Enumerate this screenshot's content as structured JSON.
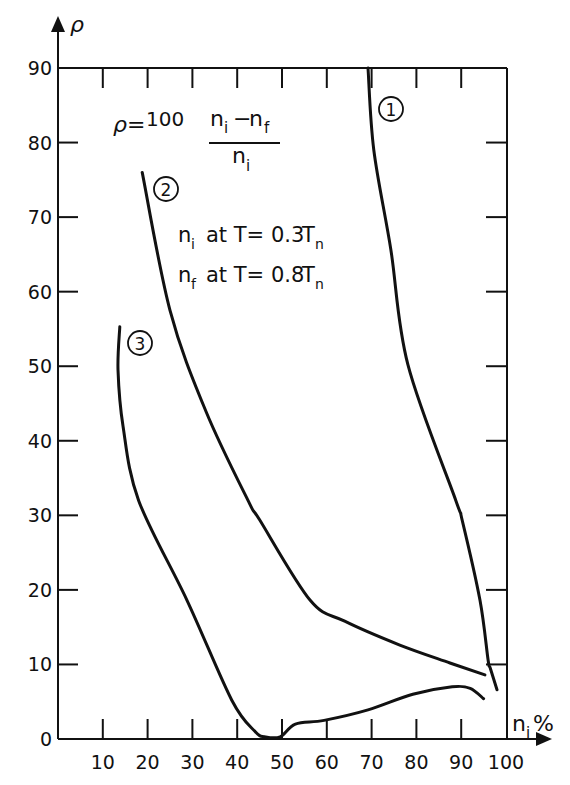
{
  "chart_data": {
    "type": "line",
    "title": "",
    "xlabel": "n_i %",
    "ylabel": "ρ",
    "xlim": [
      0,
      100
    ],
    "ylim": [
      0,
      90
    ],
    "grid": false,
    "x_ticks": [
      10,
      20,
      30,
      40,
      50,
      60,
      70,
      80,
      90,
      100
    ],
    "y_ticks": [
      0,
      10,
      20,
      30,
      40,
      50,
      60,
      70,
      80,
      90
    ],
    "legend": "inline circled numbers next to curves",
    "annotations": {
      "formula_lhs": "ρ =",
      "formula_coef": "100",
      "formula_num": "n_i − n_f",
      "formula_den": "n_i",
      "cond1": "n_i at T= 0.3 T_n",
      "cond2": "n_f at T= 0.8 T_n"
    },
    "series": [
      {
        "name": "1",
        "label": "①",
        "points": [
          [
            69.2,
            90
          ],
          [
            70.5,
            79
          ],
          [
            74.3,
            65.6
          ],
          [
            78.1,
            50.2
          ],
          [
            88.8,
            32
          ],
          [
            90.2,
            29.4
          ],
          [
            94.2,
            18.6
          ],
          [
            96,
            10.6
          ],
          [
            96.5,
            9.5
          ],
          [
            98,
            6.6
          ]
        ]
      },
      {
        "name": "2",
        "label": "②",
        "points": [
          [
            18.8,
            76
          ],
          [
            25,
            57.5
          ],
          [
            33,
            44
          ],
          [
            42.4,
            32
          ],
          [
            45,
            29.4
          ],
          [
            56.3,
            18.6
          ],
          [
            64,
            15.8
          ],
          [
            76.3,
            12.6
          ],
          [
            87.5,
            10.2
          ],
          [
            95.3,
            8.6
          ]
        ]
      },
      {
        "name": "3",
        "label": "③",
        "points": [
          [
            13.8,
            55.3
          ],
          [
            13.4,
            49.5
          ],
          [
            14.5,
            42
          ],
          [
            18,
            32
          ],
          [
            28.8,
            18.6
          ],
          [
            38.8,
            5.2
          ],
          [
            44,
            1
          ],
          [
            46.2,
            0.3
          ],
          [
            49.6,
            0.3
          ],
          [
            53,
            2
          ],
          [
            59.4,
            2.5
          ],
          [
            69.2,
            3.9
          ],
          [
            79.2,
            6
          ],
          [
            88,
            7
          ],
          [
            92,
            6.8
          ],
          [
            95,
            5.4
          ]
        ]
      }
    ]
  },
  "axes": {
    "y_symbol": "ρ",
    "x_symbol_main": "n",
    "x_symbol_sub": "i",
    "x_unit": "%"
  },
  "labels": {
    "formula_rho": "ρ",
    "formula_eq": "=",
    "formula_coef": "100",
    "num_n1": "n",
    "num_i": "i",
    "num_minus": "−",
    "num_n2": "n",
    "num_f": "f",
    "den_n": "n",
    "den_i": "i",
    "c1_n": "n",
    "c1_sub": "i",
    "c1_text": "at T= 0.3",
    "c1_T": "T",
    "c1_Tsub": "n",
    "c2_n": "n",
    "c2_sub": "f",
    "c2_text": "at T= 0.8",
    "c2_T": "T",
    "c2_Tsub": "n",
    "curve1": "1",
    "curve2": "2",
    "curve3": "3"
  }
}
